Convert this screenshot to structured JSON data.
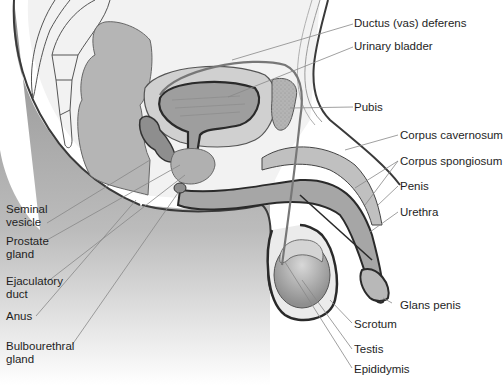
{
  "figure": {
    "colors": {
      "background": "#ffffff",
      "body_shadow": "#8a8a8a",
      "organ_fill": "#a8a8a8",
      "organ_light": "#d2d2d2",
      "outline": "#3a3a3a",
      "leader_line": "#888888",
      "label_text": "#1e1e1e"
    }
  },
  "labels": {
    "right": [
      {
        "id": "ductus_deferens",
        "text": "Ductus (vas) deferens"
      },
      {
        "id": "urinary_bladder",
        "text": "Urinary bladder"
      },
      {
        "id": "pubis",
        "text": "Pubis"
      },
      {
        "id": "corpus_cavernosum",
        "text": "Corpus cavernosum"
      },
      {
        "id": "corpus_spongiosum",
        "text": "Corpus spongiosum"
      },
      {
        "id": "penis",
        "text": "Penis"
      },
      {
        "id": "urethra",
        "text": "Urethra"
      },
      {
        "id": "glans_penis",
        "text": "Glans penis"
      },
      {
        "id": "scrotum",
        "text": "Scrotum"
      },
      {
        "id": "testis",
        "text": "Testis"
      },
      {
        "id": "epididymis",
        "text": "Epididymis"
      }
    ],
    "left": [
      {
        "id": "seminal_vesicle",
        "text": "Seminal vesicle"
      },
      {
        "id": "prostate_gland",
        "text": "Prostate gland"
      },
      {
        "id": "ejaculatory_duct",
        "text": "Ejaculatory duct"
      },
      {
        "id": "anus",
        "text": "Anus"
      },
      {
        "id": "bulbourethral_gland",
        "text": "Bulbourethral gland"
      }
    ]
  }
}
